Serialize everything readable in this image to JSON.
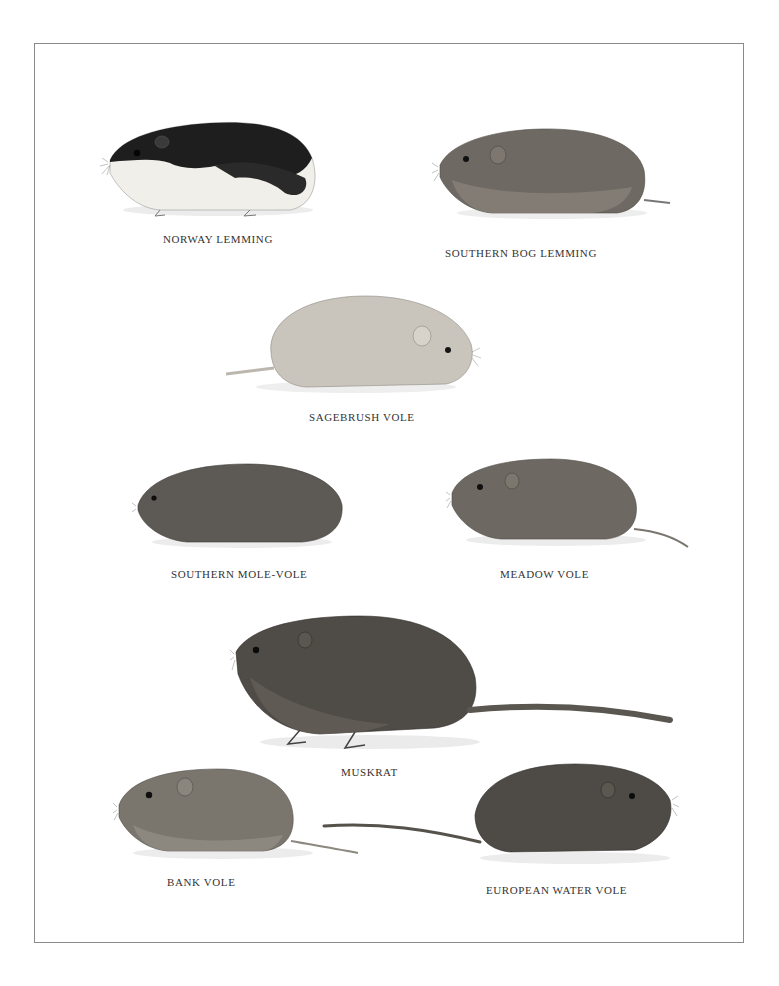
{
  "plate": {
    "border_color": "#8a8a8a",
    "background": "#ffffff"
  },
  "species": [
    {
      "id": "norway-lemming",
      "label": "NORWAY LEMMING",
      "facing": "left",
      "fur": "black-and-cream"
    },
    {
      "id": "southern-bog-lemming",
      "label": "SOUTHERN BOG LEMMING",
      "facing": "left",
      "fur": "grey-brown"
    },
    {
      "id": "sagebrush-vole",
      "label": "SAGEBRUSH VOLE",
      "facing": "right",
      "fur": "pale-grey"
    },
    {
      "id": "southern-mole-vole",
      "label": "SOUTHERN MOLE-VOLE",
      "facing": "left",
      "fur": "dark-grey"
    },
    {
      "id": "meadow-vole",
      "label": "MEADOW VOLE",
      "facing": "left",
      "fur": "grey-brown"
    },
    {
      "id": "muskrat",
      "label": "MUSKRAT",
      "facing": "left",
      "fur": "dark-brown"
    },
    {
      "id": "bank-vole",
      "label": "BANK VOLE",
      "facing": "left",
      "fur": "grey-brown"
    },
    {
      "id": "european-water-vole",
      "label": "EUROPEAN WATER VOLE",
      "facing": "right",
      "fur": "dark-brown"
    }
  ]
}
